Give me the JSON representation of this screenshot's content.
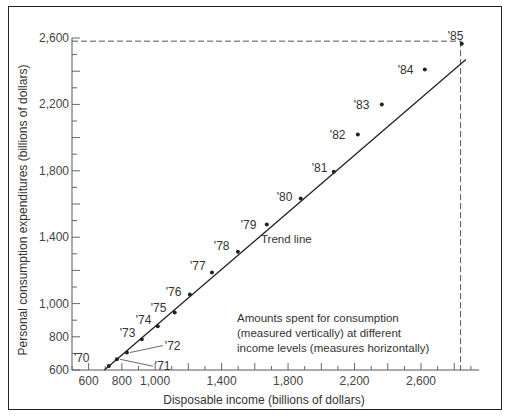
{
  "chart_data": {
    "type": "scatter",
    "title": "",
    "xlabel": "Disposable income (billions of dollars)",
    "ylabel": "Personal consumption expenditures (billions of dollars)",
    "xlim": [
      500,
      2950
    ],
    "ylim": [
      600,
      2600
    ],
    "x_ticks": [
      600,
      800,
      1000,
      1400,
      1800,
      2200,
      2600
    ],
    "x_tick_labels": [
      "600",
      "800",
      "1,000",
      "1,400",
      "1,800",
      "2,200",
      "2,600"
    ],
    "y_ticks": [
      600,
      800,
      1000,
      1400,
      1800,
      2200,
      2600
    ],
    "y_tick_labels": [
      "600",
      "800",
      "1,000",
      "1,400",
      "1,800",
      "2,200",
      "2,600"
    ],
    "grid": false,
    "legend": null,
    "series": [
      {
        "name": "Consumption vs. income (1970-1985)",
        "points": [
          {
            "label": "'70",
            "x": 722,
            "y": 624
          },
          {
            "label": "'71",
            "x": 770,
            "y": 665
          },
          {
            "label": "'72",
            "x": 830,
            "y": 705
          },
          {
            "label": "'73",
            "x": 920,
            "y": 785
          },
          {
            "label": "'74",
            "x": 1016,
            "y": 863
          },
          {
            "label": "'75",
            "x": 1118,
            "y": 947
          },
          {
            "label": "'76",
            "x": 1209,
            "y": 1055
          },
          {
            "label": "'77",
            "x": 1342,
            "y": 1188
          },
          {
            "label": "'78",
            "x": 1498,
            "y": 1313
          },
          {
            "label": "'79",
            "x": 1672,
            "y": 1476
          },
          {
            "label": "'80",
            "x": 1876,
            "y": 1633
          },
          {
            "label": "'81",
            "x": 2075,
            "y": 1795
          },
          {
            "label": "'82",
            "x": 2220,
            "y": 2018
          },
          {
            "label": "'83",
            "x": 2364,
            "y": 2199
          },
          {
            "label": "'84",
            "x": 2623,
            "y": 2410
          },
          {
            "label": "'85",
            "x": 2845,
            "y": 2566
          }
        ]
      },
      {
        "name": "Trend line",
        "type": "line",
        "points": [
          {
            "x": 695,
            "y": 600
          },
          {
            "x": 2870,
            "y": 2470
          }
        ]
      }
    ],
    "reference_lines": [
      {
        "orientation": "horizontal",
        "style": "dashed",
        "y": 2581,
        "x_range": [
          500,
          2845
        ]
      },
      {
        "orientation": "vertical",
        "style": "dashed",
        "x": 2838,
        "y_range": [
          600,
          2581
        ]
      }
    ],
    "annotations": [
      {
        "text": "Trend line",
        "near": "'79"
      },
      {
        "text": "Amounts spent for consumption (measured vertically) at different income levels (measures horizontally)"
      }
    ]
  },
  "labels": {
    "trend_line": "Trend line",
    "note_line1": "Amounts spent for consumption",
    "note_line2": "(measured vertically) at different",
    "note_line3": "income levels (measures horizontally)"
  }
}
